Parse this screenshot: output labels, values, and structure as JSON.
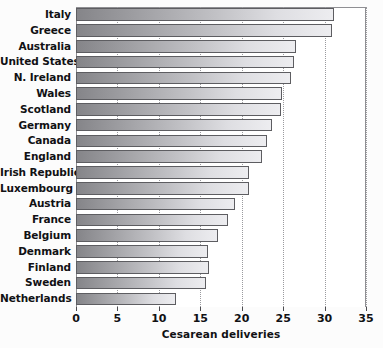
{
  "chart_data": {
    "type": "bar",
    "orientation": "horizontal",
    "title": "",
    "xlabel": "Cesarean deliveries",
    "ylabel": "",
    "xlim": [
      0,
      35
    ],
    "xticks": [
      0,
      5,
      10,
      15,
      20,
      25,
      30,
      35
    ],
    "grid": "vertical-dotted",
    "legend": "none",
    "categories": [
      "Italy",
      "Greece",
      "Australia",
      "United States",
      "N. Ireland",
      "Wales",
      "Scotland",
      "Germany",
      "Canada",
      "England",
      "Irish Republic",
      "Luxembourg",
      "Austria",
      "France",
      "Belgium",
      "Denmark",
      "Finland",
      "Sweden",
      "Netherlands"
    ],
    "values": [
      31.1,
      30.9,
      26.6,
      26.3,
      25.9,
      24.9,
      24.8,
      23.7,
      23.1,
      22.5,
      20.9,
      20.9,
      19.2,
      18.4,
      17.1,
      15.9,
      16.0,
      15.7,
      12.1
    ]
  },
  "colors": {
    "bar_gradient_start": "#858589",
    "bar_gradient_end": "#ededf0",
    "bar_border": "#5d5d61",
    "grid": "#9a9a9e",
    "axis": "#8f8f93",
    "text": "#111114",
    "background": "#ffffff"
  }
}
